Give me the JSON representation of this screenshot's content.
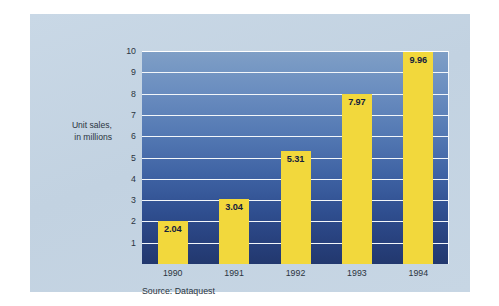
{
  "card": {
    "background_color": "#c5d5e3"
  },
  "chart_data": {
    "type": "bar",
    "title": "",
    "subtitle": "",
    "xlabel": "",
    "ylabel": "Unit sales, in millions",
    "ylabel_lines": [
      "Unit sales,",
      "in millions"
    ],
    "categories": [
      "1990",
      "1991",
      "1992",
      "1993",
      "1994"
    ],
    "values": [
      2.04,
      3.04,
      5.31,
      7.97,
      9.96
    ],
    "value_labels": [
      "2.04",
      "3.04",
      "5.31",
      "7.97",
      "9.96"
    ],
    "ylim": [
      0,
      10
    ],
    "yticks": [
      1,
      2,
      3,
      4,
      5,
      6,
      7,
      8,
      9,
      10
    ],
    "ytick_labels": [
      "1",
      "2",
      "3",
      "4",
      "5",
      "6",
      "7",
      "8",
      "9",
      "10"
    ],
    "grid": true,
    "grid_orientation": "horizontal",
    "grid_color": "#f2f6fa",
    "legend": false,
    "legend_position": "none",
    "bar_color": "#f2d83c",
    "value_label_color": "#14213d",
    "plot_background_top_color": "#7f9fc6",
    "plot_background_bottom_color": "#22386e",
    "annotation": "Source: Dataquest"
  },
  "footer": {
    "source": "Source: Dataquest"
  }
}
